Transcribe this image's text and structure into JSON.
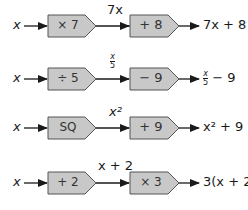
{
  "colors": {
    "box_fill": "#c8c8c8",
    "box_stroke": "#555555",
    "line": "#1a1a1a"
  },
  "machines": [
    {
      "input": "x",
      "op1": "× 7",
      "intermediate": "7x",
      "op2": "+ 8",
      "output": "7x + 8"
    },
    {
      "input": "x",
      "op1": "÷ 5",
      "intermediate": "x/5",
      "intermediate_num": "x",
      "intermediate_den": "5",
      "op2": "− 9",
      "output": "x/5 − 9",
      "output_num": "x",
      "output_den": "5",
      "output_suffix": "− 9"
    },
    {
      "input": "x",
      "op1": "SQ",
      "intermediate": "x²",
      "op2": "+ 9",
      "output": "x² + 9"
    },
    {
      "input": "x",
      "op1": "+ 2",
      "intermediate": "x + 2",
      "op2": "× 3",
      "output": "3(x + 2)"
    }
  ]
}
